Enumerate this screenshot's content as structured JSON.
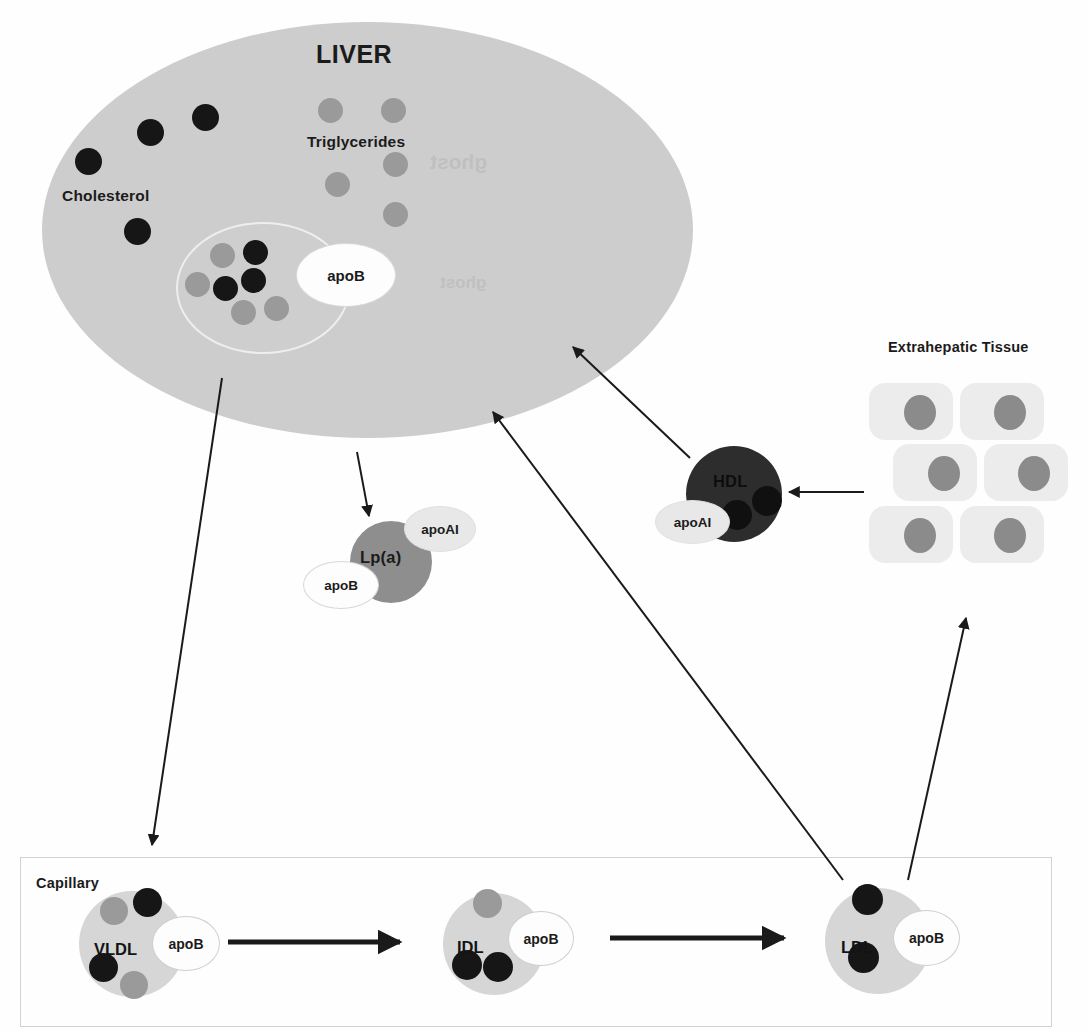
{
  "diagram": {
    "liver": {
      "title": "LIVER",
      "cholesterol_label": "Cholesterol",
      "triglycerides_label": "Triglycerides",
      "nascent_particle_apo_label": "apoB",
      "cholesterol_dots": [
        {
          "x": 75,
          "y": 148
        },
        {
          "x": 137,
          "y": 119
        },
        {
          "x": 192,
          "y": 104
        },
        {
          "x": 124,
          "y": 218
        }
      ],
      "triglyceride_dots": [
        {
          "x": 318,
          "y": 98
        },
        {
          "x": 381,
          "y": 98
        },
        {
          "x": 383,
          "y": 152
        },
        {
          "x": 325,
          "y": 172
        },
        {
          "x": 383,
          "y": 202
        }
      ],
      "nascent_dots": [
        {
          "x": 210,
          "y": 243,
          "tone": "gray"
        },
        {
          "x": 243,
          "y": 240,
          "tone": "dark"
        },
        {
          "x": 185,
          "y": 272,
          "tone": "gray"
        },
        {
          "x": 213,
          "y": 276,
          "tone": "dark"
        },
        {
          "x": 241,
          "y": 268,
          "tone": "dark"
        },
        {
          "x": 231,
          "y": 300,
          "tone": "gray"
        },
        {
          "x": 264,
          "y": 296,
          "tone": "gray"
        }
      ]
    },
    "lpa": {
      "core_label": "Lp(a)",
      "apo_ai_label": "apoAI",
      "apo_b_label": "apoB"
    },
    "hdl": {
      "core_label": "HDL",
      "apo_ai_label": "apoAI",
      "inner_dots": [
        {
          "x": 722,
          "y": 500
        },
        {
          "x": 752,
          "y": 486
        }
      ]
    },
    "extrahepatic": {
      "title": "Extrahepatic Tissue",
      "cells": [
        {
          "x": 869,
          "y": 383,
          "w": 84,
          "h": 57,
          "nx": 904,
          "ny": 395,
          "nw": 32,
          "nh": 35
        },
        {
          "x": 960,
          "y": 383,
          "w": 84,
          "h": 57,
          "nx": 994,
          "ny": 395,
          "nw": 32,
          "nh": 35
        },
        {
          "x": 893,
          "y": 444,
          "w": 84,
          "h": 57,
          "nx": 928,
          "ny": 456,
          "nw": 32,
          "nh": 35
        },
        {
          "x": 984,
          "y": 444,
          "w": 84,
          "h": 57,
          "nx": 1018,
          "ny": 456,
          "nw": 32,
          "nh": 35
        },
        {
          "x": 869,
          "y": 506,
          "w": 84,
          "h": 57,
          "nx": 904,
          "ny": 518,
          "nw": 32,
          "nh": 35
        },
        {
          "x": 960,
          "y": 506,
          "w": 84,
          "h": 57,
          "nx": 994,
          "ny": 518,
          "nw": 32,
          "nh": 35
        }
      ]
    },
    "capillary": {
      "label": "Capillary",
      "particles": [
        {
          "name": "VLDL",
          "apo_label": "apoB",
          "core": {
            "x": 79,
            "y": 891,
            "d": 106
          },
          "name_pos": {
            "x": 94,
            "y": 940
          },
          "apo": {
            "x": 152,
            "y": 916,
            "w": 66,
            "h": 53
          },
          "dots": [
            {
              "x": 100,
              "y": 897,
              "d": 28,
              "tone": "gray"
            },
            {
              "x": 133,
              "y": 888,
              "d": 29,
              "tone": "dark"
            },
            {
              "x": 89,
              "y": 953,
              "d": 29,
              "tone": "dark"
            },
            {
              "x": 120,
              "y": 971,
              "d": 28,
              "tone": "gray"
            }
          ]
        },
        {
          "name": "IDL",
          "apo_label": "apoB",
          "core": {
            "x": 443,
            "y": 893,
            "d": 102
          },
          "name_pos": {
            "x": 457,
            "y": 938
          },
          "apo": {
            "x": 508,
            "y": 911,
            "w": 64,
            "h": 53
          },
          "dots": [
            {
              "x": 473,
              "y": 889,
              "d": 29,
              "tone": "gray"
            },
            {
              "x": 452,
              "y": 950,
              "d": 30,
              "tone": "dark"
            },
            {
              "x": 483,
              "y": 952,
              "d": 30,
              "tone": "dark"
            }
          ]
        },
        {
          "name": "LDL",
          "apo_label": "apoB",
          "core": {
            "x": 825,
            "y": 888,
            "d": 106
          },
          "name_pos": {
            "x": 841,
            "y": 938
          },
          "apo": {
            "x": 893,
            "y": 910,
            "w": 65,
            "h": 54
          },
          "dots": [
            {
              "x": 852,
              "y": 884,
              "d": 31,
              "tone": "dark"
            },
            {
              "x": 848,
              "y": 942,
              "d": 31,
              "tone": "dark"
            }
          ]
        }
      ],
      "flow_arrows": [
        {
          "x1": 228,
          "y1": 942,
          "x2": 400,
          "y2": 942
        },
        {
          "x1": 610,
          "y1": 938,
          "x2": 784,
          "y2": 938
        }
      ]
    },
    "pathway_arrows": [
      {
        "id": "liver-to-capillary",
        "x1": 222,
        "y1": 378,
        "x2": 152,
        "y2": 845
      },
      {
        "id": "liver-to-lpa",
        "x1": 357,
        "y1": 452,
        "x2": 369,
        "y2": 516
      },
      {
        "id": "hdl-to-liver",
        "x1": 690,
        "y1": 458,
        "x2": 573,
        "y2": 347
      },
      {
        "id": "ldl-to-liver",
        "x1": 843,
        "y1": 880,
        "x2": 493,
        "y2": 412
      },
      {
        "id": "tissue-to-hdl",
        "x1": 864,
        "y1": 492,
        "x2": 789,
        "y2": 492
      },
      {
        "id": "ldl-to-tissue",
        "x1": 908,
        "y1": 880,
        "x2": 966,
        "y2": 618
      }
    ],
    "colors": {
      "liver_fill": "#cdcdcd",
      "cholesterol_dot": "#161616",
      "triglyceride_dot": "#9a9a9a",
      "lpa_core": "#8e8e8e",
      "hdl_core": "#2d2d2d",
      "lipoprotein_core": "#d6d6d6",
      "tissue_cell": "#ececec",
      "tissue_nucleus": "#8b8b8b",
      "arrow": "#1a1a1a",
      "capillary_border": "#d2d2d2"
    }
  }
}
